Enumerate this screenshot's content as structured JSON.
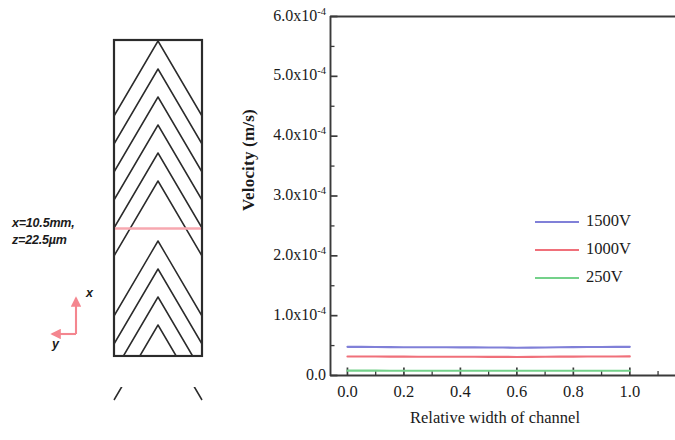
{
  "schematic": {
    "name": "chevron-channel-cross-section",
    "condition_line1": "x=10.5mm,",
    "condition_line2": "z=22.5µm",
    "axis_x_label": "x",
    "axis_y_label": "y",
    "axis_arrow_color": "#f4868f",
    "section_line_color": "#f7a8b0",
    "outline_color": "#2b2b2b",
    "chevron_count": 11
  },
  "chart_data": {
    "type": "line",
    "title": "",
    "xlabel": "Relative width of channel",
    "ylabel": "Velocity (m/s)",
    "xlim": [
      -0.06,
      1.16
    ],
    "ylim": [
      0.0,
      0.0006
    ],
    "grid": false,
    "legend_position": "right-middle",
    "xticks": [
      0.0,
      0.2,
      0.4,
      0.6,
      0.8,
      1.0
    ],
    "xtick_labels": [
      "0.0",
      "0.2",
      "0.4",
      "0.6",
      "0.8",
      "1.0"
    ],
    "yticks": [
      0.0,
      0.0001,
      0.0002,
      0.0003,
      0.0004,
      0.0005,
      0.0006
    ],
    "ytick_labels": [
      "0.0",
      "1.0x10",
      "2.0x10",
      "3.0x10",
      "4.0x10",
      "5.0x10",
      "6.0x10"
    ],
    "ytick_exponents": [
      "",
      "-4",
      "-4",
      "-4",
      "-4",
      "-4",
      "-4"
    ],
    "minor_ticks_per_interval": 1,
    "x": [
      0.0,
      0.05,
      0.1,
      0.15,
      0.2,
      0.25,
      0.3,
      0.35,
      0.4,
      0.45,
      0.5,
      0.55,
      0.6,
      0.65,
      0.7,
      0.75,
      0.8,
      0.85,
      0.9,
      0.95,
      1.0
    ],
    "series": [
      {
        "name": "1500V",
        "color": "#8080d8",
        "values": [
          4.79e-05,
          4.78e-05,
          4.76e-05,
          4.74e-05,
          4.72e-05,
          4.71e-05,
          4.71e-05,
          4.71e-05,
          4.7e-05,
          4.7e-05,
          4.69e-05,
          4.67e-05,
          4.65e-05,
          4.66e-05,
          4.69e-05,
          4.72e-05,
          4.74e-05,
          4.76e-05,
          4.77e-05,
          4.78e-05,
          4.79e-05
        ]
      },
      {
        "name": "1000V",
        "color": "#f0707a",
        "values": [
          3.18e-05,
          3.18e-05,
          3.17e-05,
          3.16e-05,
          3.15e-05,
          3.14e-05,
          3.14e-05,
          3.14e-05,
          3.13e-05,
          3.13e-05,
          3.12e-05,
          3.11e-05,
          3.1e-05,
          3.11e-05,
          3.13e-05,
          3.15e-05,
          3.16e-05,
          3.17e-05,
          3.18e-05,
          3.18e-05,
          3.19e-05
        ]
      },
      {
        "name": "250V",
        "color": "#74d18a",
        "values": [
          8.1e-06,
          8.1e-06,
          8.1e-06,
          8e-06,
          8e-06,
          8e-06,
          8e-06,
          8e-06,
          8e-06,
          7.9e-06,
          7.9e-06,
          7.9e-06,
          7.9e-06,
          7.9e-06,
          7.9e-06,
          7.9e-06,
          7.9e-06,
          7.9e-06,
          7.9e-06,
          7.9e-06,
          7.9e-06
        ]
      }
    ]
  }
}
